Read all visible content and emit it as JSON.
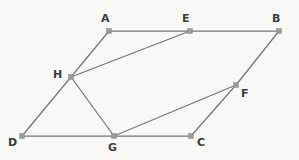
{
  "figure": {
    "name": "labeled-polygon-diagram",
    "width": 299,
    "height": 160,
    "background_color": "#f8f8f7",
    "line_color": "#76767a",
    "vertex_color": "#9a9a9c",
    "label_color": "#3b3b3d",
    "vertices": [
      {
        "id": "A",
        "label": "A",
        "x": 109,
        "y": 31,
        "label_x": 101,
        "label_y": 13
      },
      {
        "id": "E",
        "label": "E",
        "x": 190,
        "y": 31,
        "label_x": 182,
        "label_y": 13
      },
      {
        "id": "B",
        "label": "B",
        "x": 279,
        "y": 31,
        "label_x": 272,
        "label_y": 13
      },
      {
        "id": "H",
        "label": "H",
        "x": 71,
        "y": 77,
        "label_x": 53,
        "label_y": 69
      },
      {
        "id": "F",
        "label": "F",
        "x": 236,
        "y": 85,
        "label_x": 241,
        "label_y": 88
      },
      {
        "id": "D",
        "label": "D",
        "x": 22,
        "y": 136,
        "label_x": 8,
        "label_y": 137
      },
      {
        "id": "G",
        "label": "G",
        "x": 114,
        "y": 136,
        "label_x": 108,
        "label_y": 142
      },
      {
        "id": "C",
        "label": "C",
        "x": 191,
        "y": 136,
        "label_x": 197,
        "label_y": 137
      }
    ],
    "edges": [
      {
        "from": "A",
        "to": "E"
      },
      {
        "from": "E",
        "to": "B"
      },
      {
        "from": "D",
        "to": "G"
      },
      {
        "from": "G",
        "to": "C"
      },
      {
        "from": "A",
        "to": "H"
      },
      {
        "from": "H",
        "to": "D"
      },
      {
        "from": "B",
        "to": "F"
      },
      {
        "from": "F",
        "to": "C"
      },
      {
        "from": "H",
        "to": "E"
      },
      {
        "from": "H",
        "to": "G"
      },
      {
        "from": "G",
        "to": "F"
      }
    ]
  }
}
